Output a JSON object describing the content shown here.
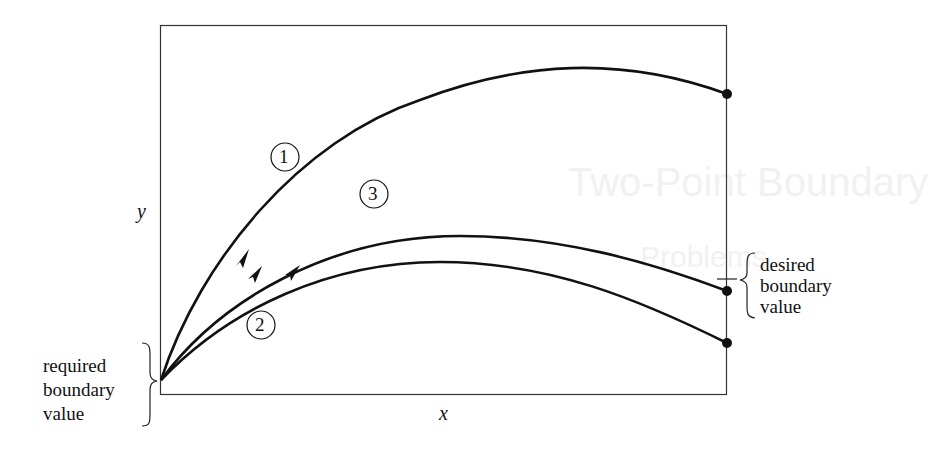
{
  "watermark": {
    "line1": "Two-Point Boundary",
    "line2": "Problems"
  },
  "axes": {
    "x_label": "x",
    "y_label": "y"
  },
  "curves": [
    {
      "id": "1",
      "label": "1",
      "description": "overshoot trial trajectory",
      "end": "above desired value"
    },
    {
      "id": "2",
      "label": "2",
      "description": "undershoot trial trajectory",
      "end": "below desired value"
    },
    {
      "id": "3",
      "label": "3",
      "description": "converged trajectory",
      "end": "at desired value"
    }
  ],
  "annotations": {
    "left_brace": {
      "line1": "required",
      "line2": "boundary",
      "line3": "value"
    },
    "right_brace": {
      "line1": "desired",
      "line2": "boundary",
      "line3": "value"
    }
  },
  "colors": {
    "stroke": "#111111",
    "frame": "#333333",
    "background": "#ffffff"
  }
}
